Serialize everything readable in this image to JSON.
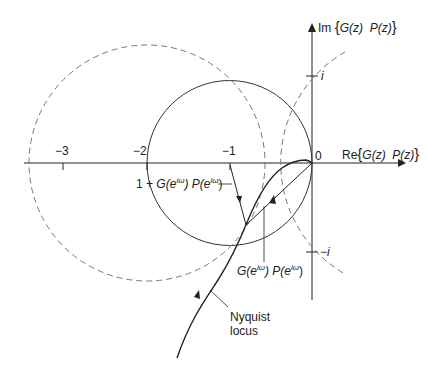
{
  "diagram": {
    "axes": {
      "real_label": "Re{G(z) P(z)}",
      "real_label_parts": {
        "prefix": "Re",
        "open": "{",
        "g": "G(z)",
        "p": "P(z)",
        "close": "}"
      },
      "imag_label": "Im{G(z) P(z)}",
      "imag_label_parts": {
        "prefix": "Im",
        "open": "{",
        "g": "G(z)",
        "p": "P(z)",
        "close": "}"
      },
      "origin_label": "0",
      "real_ticks": [
        {
          "value": -3,
          "label": "−3"
        },
        {
          "value": -2,
          "label": "−2"
        },
        {
          "value": -1,
          "label": "−1"
        }
      ],
      "imag_ticks": [
        {
          "value": 1,
          "label": "i"
        },
        {
          "value": -1,
          "label": "−i"
        }
      ]
    },
    "circles": [
      {
        "name": "unit circle centered at -1",
        "center": [
          -1,
          0
        ],
        "radius": 1,
        "style": "solid"
      },
      {
        "name": "left dashed circle",
        "center": [
          -2,
          0
        ],
        "radius": 1.45,
        "style": "dashed"
      },
      {
        "name": "right dashed circle",
        "center": [
          1.1,
          0
        ],
        "radius": 1.5,
        "style": "dashed"
      }
    ],
    "annotations": {
      "one_plus_gp": {
        "prefix": "1 + ",
        "g": "G(e",
        "g_sup": "iω",
        "mid": ") P(e",
        "p_sup": "iω",
        "end": ")"
      },
      "gp": {
        "g": "G(e",
        "g_sup": "iω",
        "mid": ") P(e",
        "p_sup": "iω",
        "end": ")"
      },
      "nyquist_line1": "Nyquist",
      "nyquist_line2": "locus"
    },
    "colors": {
      "ink": "#222222",
      "dashed": "#777777",
      "background": "#ffffff"
    }
  }
}
